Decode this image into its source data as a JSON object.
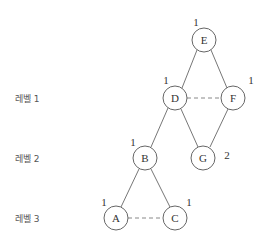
{
  "levels": [
    {
      "label": "레벨 1"
    },
    {
      "label": "레벨 2"
    },
    {
      "label": "레벨 3"
    }
  ],
  "nodes": [
    {
      "id": "E",
      "label": "E",
      "number": "1"
    },
    {
      "id": "D",
      "label": "D",
      "number": "1"
    },
    {
      "id": "F",
      "label": "F",
      "number": "1"
    },
    {
      "id": "B",
      "label": "B",
      "number": "1"
    },
    {
      "id": "G",
      "label": "G",
      "number": "2"
    },
    {
      "id": "A",
      "label": "A",
      "number": "1"
    },
    {
      "id": "C",
      "label": "C",
      "number": "1"
    }
  ],
  "edges": [
    {
      "from": "E",
      "to": "D",
      "style": "solid"
    },
    {
      "from": "E",
      "to": "F",
      "style": "solid"
    },
    {
      "from": "D",
      "to": "F",
      "style": "dashed"
    },
    {
      "from": "D",
      "to": "B",
      "style": "solid"
    },
    {
      "from": "D",
      "to": "G",
      "style": "solid"
    },
    {
      "from": "F",
      "to": "G",
      "style": "solid"
    },
    {
      "from": "B",
      "to": "A",
      "style": "solid"
    },
    {
      "from": "B",
      "to": "C",
      "style": "solid"
    },
    {
      "from": "A",
      "to": "C",
      "style": "dashed"
    }
  ]
}
